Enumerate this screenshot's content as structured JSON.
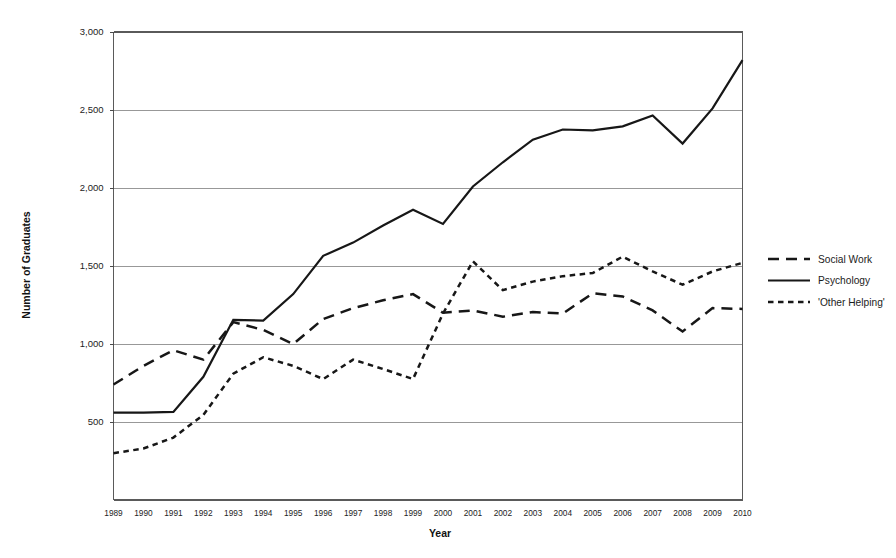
{
  "chart_data": {
    "type": "line",
    "title": "",
    "xlabel": "Year",
    "ylabel": "Number of Graduates",
    "x": [
      1989,
      1990,
      1991,
      1992,
      1993,
      1994,
      1995,
      1996,
      1997,
      1998,
      1999,
      2000,
      2001,
      2002,
      2003,
      2004,
      2005,
      2006,
      2007,
      2008,
      2009,
      2010
    ],
    "categories": [
      "1989",
      "1990",
      "1991",
      "1992",
      "1993",
      "1994",
      "1995",
      "1996",
      "1997",
      "1998",
      "1999",
      "2000",
      "2001",
      "2002",
      "2003",
      "2004",
      "2005",
      "2006",
      "2007",
      "2008",
      "2009",
      "2010"
    ],
    "xlim": [
      1989,
      2010
    ],
    "ylim": [
      0,
      3000
    ],
    "yticks": [
      500,
      1000,
      1500,
      2000,
      2500,
      3000
    ],
    "ytick_labels": [
      "500",
      "1,000",
      "1,500",
      "2,000",
      "2,500",
      "3,000"
    ],
    "grid": "horizontal",
    "legend_position": "right",
    "series": [
      {
        "name": "Social Work",
        "style": "dashed-long",
        "color": "#171717",
        "values": [
          740,
          860,
          960,
          900,
          1140,
          1090,
          1000,
          1160,
          1230,
          1280,
          1320,
          1200,
          1215,
          1175,
          1205,
          1195,
          1325,
          1305,
          1215,
          1080,
          1230,
          1225
        ]
      },
      {
        "name": "Psychology",
        "style": "solid",
        "color": "#171717",
        "values": [
          560,
          560,
          565,
          790,
          1155,
          1150,
          1320,
          1565,
          1650,
          1760,
          1860,
          1770,
          2010,
          2165,
          2310,
          2375,
          2370,
          2395,
          2465,
          2285,
          2510,
          2820
        ]
      },
      {
        "name": "'Other Helping'",
        "style": "dashed-short",
        "color": "#171717",
        "values": [
          300,
          330,
          400,
          545,
          810,
          915,
          860,
          775,
          900,
          840,
          775,
          1195,
          1530,
          1345,
          1400,
          1435,
          1455,
          1560,
          1465,
          1380,
          1465,
          1520
        ]
      }
    ]
  },
  "legend": {
    "items": [
      {
        "label": "Social Work",
        "swatch": "dashed-long-swatch"
      },
      {
        "label": "Psychology",
        "swatch": "solid-swatch"
      },
      {
        "label": "'Other Helping'",
        "swatch": "dashed-short-swatch"
      }
    ]
  }
}
